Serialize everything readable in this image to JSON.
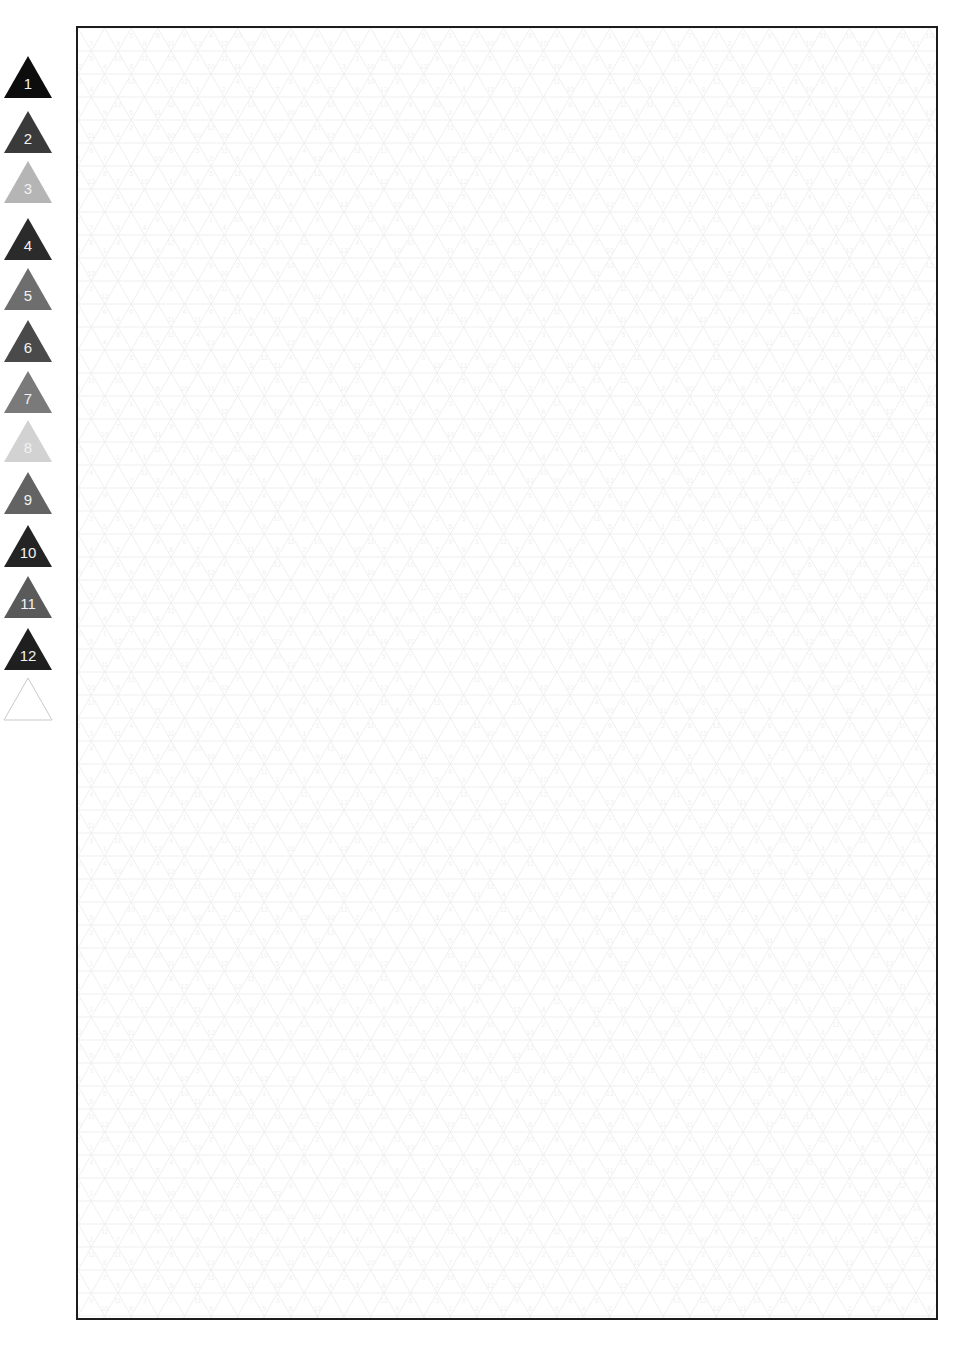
{
  "page": {
    "width": 957,
    "height": 1351,
    "background_color": "#ffffff"
  },
  "legend": {
    "name": "triangle-color-legend",
    "item_count": 13,
    "label_text_color": "#f2f2f2",
    "items": [
      {
        "number": "1",
        "color": "#0d0d0d",
        "filled": true
      },
      {
        "number": "2",
        "color": "#3a3a3a",
        "filled": true
      },
      {
        "number": "3",
        "color": "#b5b5b5",
        "filled": true
      },
      {
        "number": "4",
        "color": "#2b2b2b",
        "filled": true
      },
      {
        "number": "5",
        "color": "#6e6e6e",
        "filled": true
      },
      {
        "number": "6",
        "color": "#4a4a4a",
        "filled": true
      },
      {
        "number": "7",
        "color": "#7a7a7a",
        "filled": true
      },
      {
        "number": "8",
        "color": "#d2d2d2",
        "filled": true
      },
      {
        "number": "9",
        "color": "#636363",
        "filled": true
      },
      {
        "number": "10",
        "color": "#242424",
        "filled": true
      },
      {
        "number": "11",
        "color": "#5a5a5a",
        "filled": true
      },
      {
        "number": "12",
        "color": "#1f1f1f",
        "filled": true
      },
      {
        "number": "",
        "color": "#ffffff",
        "filled": false
      }
    ]
  },
  "grid_panel": {
    "name": "triangle-grid-panel",
    "border_color": "#1c1c1c",
    "border_width_px": 2,
    "background_color": "#ffffff",
    "line_color": "#ededed",
    "number_color": "#f0f0f0",
    "number_font_size_px": 7,
    "cell_width_px": 26.6,
    "cell_height_px": 23.0,
    "columns": 33,
    "rows": 57,
    "number_range": {
      "min": 1,
      "max": 12
    },
    "description": "Isometric triangular grid; each small triangle contains a faint number from 1 to 12 keyed to the legend colors."
  },
  "chart_data": {
    "type": "heatmap",
    "xlabel": "",
    "ylabel": "",
    "legend_position": "left",
    "categories": [
      "1",
      "2",
      "3",
      "4",
      "5",
      "6",
      "7",
      "8",
      "9",
      "10",
      "11",
      "12",
      ""
    ],
    "values": [
      1,
      2,
      3,
      4,
      5,
      6,
      7,
      8,
      9,
      10,
      11,
      12,
      0
    ],
    "colors": [
      "#0d0d0d",
      "#3a3a3a",
      "#b5b5b5",
      "#2b2b2b",
      "#6e6e6e",
      "#4a4a4a",
      "#7a7a7a",
      "#d2d2d2",
      "#636363",
      "#242424",
      "#5a5a5a",
      "#1f1f1f",
      "#ffffff"
    ],
    "grid": true
  }
}
